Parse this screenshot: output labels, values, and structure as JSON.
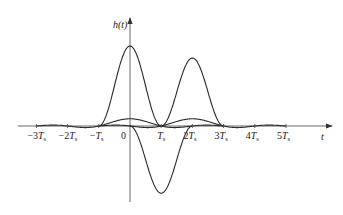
{
  "diagram": {
    "y_axis_label": "h(t)",
    "x_axis_label": "t",
    "origin_label": "0",
    "tick_labels": [
      {
        "pre": "−3",
        "T": "T",
        "sub": "s",
        "n": -3
      },
      {
        "pre": "−2",
        "T": "T",
        "sub": "s",
        "n": -2
      },
      {
        "pre": "−",
        "T": "T",
        "sub": "s",
        "n": -1
      },
      {
        "pre": "",
        "T": "T",
        "sub": "s",
        "n": 1
      },
      {
        "pre": "2",
        "T": "T",
        "sub": "s",
        "n": 2
      },
      {
        "pre": "3",
        "T": "T",
        "sub": "s",
        "n": 3
      },
      {
        "pre": "4",
        "T": "T",
        "sub": "s",
        "n": 4
      },
      {
        "pre": "5",
        "T": "T",
        "sub": "s",
        "n": 5
      }
    ],
    "layout": {
      "origin_x": 130,
      "axis_y": 126,
      "ts_px": 31.2,
      "x_axis_start": 18,
      "x_axis_end": 332,
      "y_axis_top": 18,
      "y_axis_bottom": 202,
      "unit_px": 40
    },
    "curves": [
      {
        "name": "pulse-at-0",
        "terms": [
          {
            "a": 0.18,
            "shift": 0
          }
        ],
        "range": [
          -3,
          3
        ]
      },
      {
        "name": "pulse-at-2Ts",
        "terms": [
          {
            "a": 0.18,
            "shift": 2
          }
        ],
        "range": [
          -1,
          5
        ]
      },
      {
        "name": "sum-pulse",
        "terms": [
          {
            "a": 2.0,
            "shift": 0
          },
          {
            "a": 1.7,
            "shift": 2
          }
        ],
        "range": [
          -1,
          3
        ],
        "envelope": true
      },
      {
        "name": "difference-pulse",
        "terms": [
          {
            "a": -1.68,
            "shift": 1
          }
        ],
        "range": [
          0,
          2
        ],
        "envelope": true
      }
    ]
  }
}
